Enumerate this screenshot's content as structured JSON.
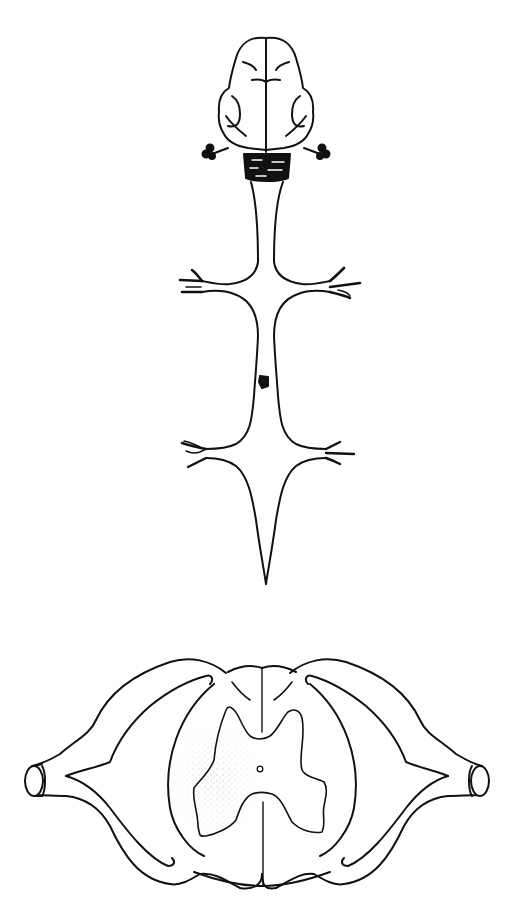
{
  "diagram": {
    "type": "anatomical-line-drawing",
    "panels": [
      {
        "id": "dorsal-view",
        "content": "brain with brainstem, spinal cord with cervical and lumbar enlargements, spinal nerve roots, focal lesion mid-thoracic"
      },
      {
        "id": "cross-section",
        "content": "transverse section of spinal cord with butterfly-shaped gray matter, central canal, dorsal and ventral nerve roots, stippled region on left"
      }
    ]
  },
  "colors": {
    "background": "#ffffff",
    "line": "#111111",
    "fill_dark": "#111111",
    "stipple": "#9a9a9a"
  }
}
